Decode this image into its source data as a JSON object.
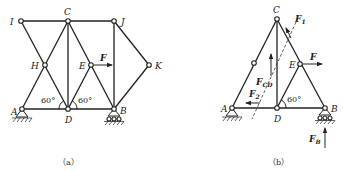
{
  "figure_a": {
    "caption": "（a）",
    "nodes": {
      "I": "I",
      "C": "C",
      "J": "J",
      "H": "H",
      "E": "E",
      "K": "K",
      "A": "A",
      "D": "D",
      "B": "B"
    },
    "force_label": "F",
    "angle_left": "60°",
    "angle_right": "60°"
  },
  "figure_b": {
    "caption": "（b）",
    "nodes": {
      "C": "C",
      "E": "E",
      "A": "A",
      "D": "D",
      "B": "B"
    },
    "force_F": "F",
    "force_F1": "F",
    "force_F1_sub": "1",
    "force_FCD": "F",
    "force_FCD_sub": "CD",
    "force_F2": "F",
    "force_F2_sub": "2",
    "force_FB": "F",
    "force_FB_sub": "B",
    "angle": "60°"
  }
}
